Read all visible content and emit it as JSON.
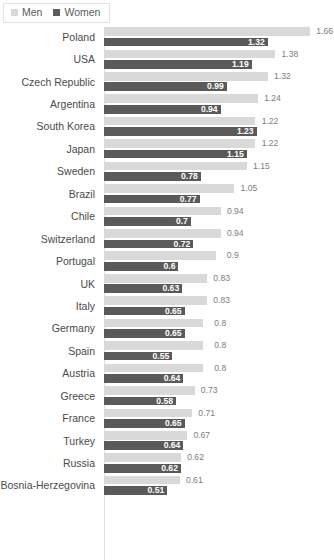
{
  "legend": {
    "position": "top-left",
    "entries": [
      {
        "label": "Men",
        "color": "#d9d9d9",
        "swatch_name": "legend-swatch-men"
      },
      {
        "label": "Women",
        "color": "#5a5a5a",
        "swatch_name": "legend-swatch-women"
      }
    ]
  },
  "chart_data": {
    "type": "bar",
    "orientation": "horizontal",
    "grouped": true,
    "title": "",
    "subtitle": "",
    "xlabel": "",
    "ylabel": "",
    "xlim": [
      0,
      1.66
    ],
    "grid": false,
    "axis_ticks_visible": false,
    "legend_position": "top-left",
    "categories": [
      "Poland",
      "USA",
      "Czech Republic",
      "Argentina",
      "South Korea",
      "Japan",
      "Sweden",
      "Brazil",
      "Chile",
      "Switzerland",
      "Portugal",
      "UK",
      "Italy",
      "Germany",
      "Spain",
      "Austria",
      "Greece",
      "France",
      "Turkey",
      "Russia",
      "Bosnia-Herzegovina"
    ],
    "series": [
      {
        "name": "Men",
        "color": "#d9d9d9",
        "values": [
          1.66,
          1.38,
          1.32,
          1.24,
          1.22,
          1.22,
          1.15,
          1.05,
          0.94,
          0.94,
          0.9,
          0.83,
          0.83,
          0.8,
          0.8,
          0.8,
          0.73,
          0.71,
          0.67,
          0.62,
          0.61
        ],
        "labels": [
          "1.66",
          "1.38",
          "1.32",
          "1.24",
          "1.22",
          "1.22",
          "1.15",
          "1.05",
          "0.94",
          "0.94",
          "0.9",
          "0.83",
          "0.83",
          "0.8",
          "0.8",
          "0.8",
          "0.73",
          "0.71",
          "0.67",
          "0.62",
          "0.61"
        ]
      },
      {
        "name": "Women",
        "color": "#5a5a5a",
        "values": [
          1.32,
          1.19,
          0.99,
          0.94,
          1.23,
          1.15,
          0.78,
          0.77,
          0.7,
          0.72,
          0.6,
          0.63,
          0.65,
          0.65,
          0.55,
          0.64,
          0.58,
          0.65,
          0.64,
          0.62,
          0.51
        ],
        "labels": [
          "1.32",
          "1.19",
          "0.99",
          "0.94",
          "1.23",
          "1.15",
          "0.78",
          "0.77",
          "0.7",
          "0.72",
          "0.6",
          "0.63",
          "0.65",
          "0.65",
          "0.55",
          "0.64",
          "0.58",
          "0.65",
          "0.64",
          "0.62",
          "0.51"
        ]
      }
    ]
  }
}
